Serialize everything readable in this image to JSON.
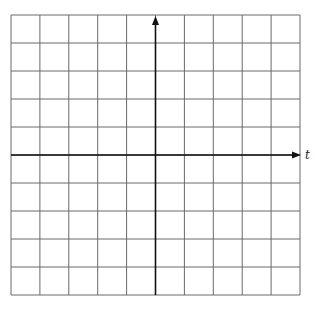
{
  "diagram": {
    "type": "coordinate-grid",
    "columns": 10,
    "rows": 10,
    "x_axis": {
      "label": "t",
      "arrow": "right",
      "position_row": 5
    },
    "y_axis": {
      "label": "",
      "arrow": "up",
      "position_column": 5
    },
    "colors": {
      "grid": "#6a6a6a",
      "axis": "#111111",
      "background": "#ffffff"
    }
  }
}
